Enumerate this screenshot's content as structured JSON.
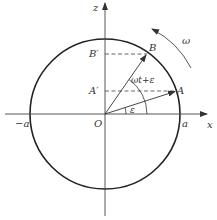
{
  "diagram": {
    "type": "rotating-vector-unit-circle",
    "colors": {
      "line": "#333333",
      "circle": "#222222",
      "background": "#ffffff"
    },
    "axes": {
      "x_label": "x",
      "z_label": "z",
      "origin_label": "O"
    },
    "ticks": {
      "neg_a": "−a",
      "pos_a": "a"
    },
    "points": {
      "A": "A",
      "B": "B",
      "A_prime": "A′",
      "B_prime": "B′"
    },
    "angles": {
      "epsilon": "ε",
      "omega_t_plus_epsilon": "ωt+ε"
    },
    "rotation": {
      "label": "ω"
    }
  }
}
